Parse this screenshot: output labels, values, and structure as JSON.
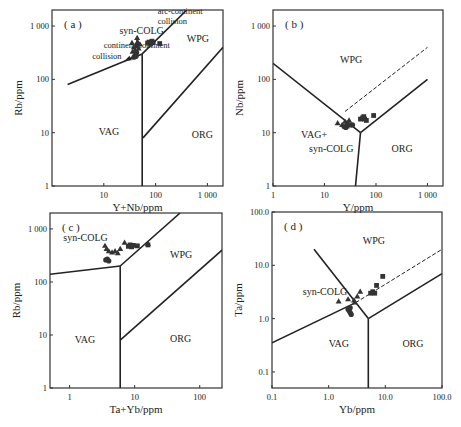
{
  "chart_data": [
    {
      "id": "a",
      "type": "scatter",
      "panel_label": "( a )",
      "xlabel": "Y+Nb/ppm",
      "ylabel": "Rb/ppm",
      "xscale": "log",
      "yscale": "log",
      "xlim": [
        1,
        2000
      ],
      "ylim": [
        1,
        2000
      ],
      "frame": {
        "left": 52,
        "right": 223,
        "top": 10,
        "bottom": 186
      },
      "xticks": [
        {
          "v": 10,
          "label": "10"
        },
        {
          "v": 100,
          "label": "100"
        },
        {
          "v": 1000,
          "label": "1 000"
        }
      ],
      "yticks": [
        {
          "v": 1,
          "label": "1"
        },
        {
          "v": 10,
          "label": "10"
        },
        {
          "v": 100,
          "label": "100"
        },
        {
          "v": 1000,
          "label": "1 000"
        }
      ],
      "boundaries": [
        {
          "style": "solid",
          "points": [
            [
              2,
              80
            ],
            [
              55,
              300
            ]
          ]
        },
        {
          "style": "solid",
          "points": [
            [
              55,
              300
            ],
            [
              400,
              2000
            ]
          ]
        },
        {
          "style": "solid",
          "points": [
            [
              55,
              300
            ],
            [
              55,
              1
            ]
          ]
        },
        {
          "style": "solid",
          "points": [
            [
              57,
              8
            ],
            [
              2000,
              400
            ]
          ]
        }
      ],
      "arrows": [
        {
          "from": [
            47,
            300
          ],
          "to": [
            25,
            220
          ],
          "label": "continent-continent collision"
        },
        {
          "from": [
            45,
            330
          ],
          "to": [
            44,
            600
          ],
          "label": "arc-continent collision"
        }
      ],
      "fields": [
        {
          "label": "VAG",
          "x": 8,
          "y": 9
        },
        {
          "label": "WPG",
          "x": 400,
          "y": 500
        },
        {
          "label": "ORG",
          "x": 500,
          "y": 8
        },
        {
          "label": "syn-COLG",
          "x": 20,
          "y": 700
        }
      ],
      "annotations": [
        {
          "label": "arc-continent",
          "x": 110,
          "y": 1700
        },
        {
          "label": "collision",
          "x": 110,
          "y": 1100
        },
        {
          "label": "continent-continent",
          "x": 10,
          "y": 380
        },
        {
          "label": "collision",
          "x": 6,
          "y": 240
        }
      ],
      "series": [
        {
          "name": "triangle",
          "marker": "triangle",
          "points": [
            [
              35,
              480
            ],
            [
              38,
              400
            ],
            [
              40,
              350
            ],
            [
              42,
              420
            ],
            [
              45,
              500
            ],
            [
              44,
              600
            ],
            [
              47,
              380
            ],
            [
              50,
              450
            ],
            [
              36,
              330
            ],
            [
              41,
              300
            ]
          ]
        },
        {
          "name": "circle",
          "marker": "circle",
          "points": [
            [
              38,
              260
            ],
            [
              40,
              280
            ],
            [
              42,
              270
            ],
            [
              43,
              320
            ]
          ]
        },
        {
          "name": "square",
          "marker": "square",
          "points": [
            [
              70,
              480
            ],
            [
              75,
              500
            ],
            [
              80,
              460
            ],
            [
              85,
              520
            ],
            [
              90,
              490
            ],
            [
              120,
              470
            ]
          ]
        }
      ]
    },
    {
      "id": "b",
      "type": "scatter",
      "panel_label": "( b )",
      "xlabel": "Y/ppm",
      "ylabel": "Nb/ppm",
      "xscale": "log",
      "yscale": "log",
      "xlim": [
        1,
        2000
      ],
      "ylim": [
        1,
        2000
      ],
      "frame": {
        "left": 273,
        "right": 443,
        "top": 10,
        "bottom": 186
      },
      "xticks": [
        {
          "v": 1,
          "label": "1"
        },
        {
          "v": 10,
          "label": "10"
        },
        {
          "v": 100,
          "label": "100"
        },
        {
          "v": 1000,
          "label": "1 000"
        }
      ],
      "yticks": [
        {
          "v": 1,
          "label": "1"
        },
        {
          "v": 10,
          "label": "10"
        },
        {
          "v": 100,
          "label": "100"
        },
        {
          "v": 1000,
          "label": "1 000"
        }
      ],
      "boundaries": [
        {
          "style": "solid",
          "points": [
            [
              1,
              200
            ],
            [
              50,
              10
            ]
          ]
        },
        {
          "style": "solid",
          "points": [
            [
              50,
              10
            ],
            [
              1000,
              100
            ]
          ]
        },
        {
          "style": "solid",
          "points": [
            [
              50,
              10
            ],
            [
              40,
              1
            ]
          ]
        },
        {
          "style": "dashed",
          "points": [
            [
              25,
              25
            ],
            [
              1000,
              400
            ]
          ]
        }
      ],
      "fields": [
        {
          "label": "WPG",
          "x": 20,
          "y": 200
        },
        {
          "label": "VAG+",
          "x": 3.5,
          "y": 8
        },
        {
          "label": "syn-COLG",
          "x": 5,
          "y": 4.3
        },
        {
          "label": "ORG",
          "x": 200,
          "y": 4.3
        }
      ],
      "series": [
        {
          "name": "triangle",
          "marker": "triangle",
          "points": [
            [
              18,
              15
            ],
            [
              22,
              14
            ],
            [
              25,
              16
            ],
            [
              28,
              15
            ],
            [
              30,
              17
            ],
            [
              27,
              13
            ]
          ]
        },
        {
          "name": "circle",
          "marker": "circle",
          "points": [
            [
              24,
              13
            ],
            [
              26,
              12.5
            ],
            [
              28,
              14
            ],
            [
              32,
              14
            ],
            [
              35,
              14
            ]
          ]
        },
        {
          "name": "square",
          "marker": "square",
          "points": [
            [
              50,
              18
            ],
            [
              55,
              19
            ],
            [
              60,
              18
            ],
            [
              65,
              17
            ],
            [
              58,
              20
            ],
            [
              90,
              21
            ]
          ]
        }
      ]
    },
    {
      "id": "c",
      "type": "scatter",
      "panel_label": "( c )",
      "xlabel": "Ta+Yb/ppm",
      "ylabel": "Rb/ppm",
      "xscale": "log",
      "yscale": "log",
      "xlim": [
        0.5,
        220
      ],
      "ylim": [
        1,
        2000
      ],
      "frame": {
        "left": 50,
        "right": 222,
        "top": 213,
        "bottom": 388
      },
      "xticks": [
        {
          "v": 1,
          "label": "1"
        },
        {
          "v": 10,
          "label": "10"
        },
        {
          "v": 100,
          "label": "100"
        }
      ],
      "yticks": [
        {
          "v": 1,
          "label": "1"
        },
        {
          "v": 10,
          "label": "10"
        },
        {
          "v": 100,
          "label": "100"
        },
        {
          "v": 1000,
          "label": "1 000"
        }
      ],
      "boundaries": [
        {
          "style": "solid",
          "points": [
            [
              0.5,
              140
            ],
            [
              6,
              200
            ]
          ]
        },
        {
          "style": "solid",
          "points": [
            [
              6,
              200
            ],
            [
              50,
              2000
            ]
          ]
        },
        {
          "style": "solid",
          "points": [
            [
              6,
              200
            ],
            [
              6,
              1
            ]
          ]
        },
        {
          "style": "solid",
          "points": [
            [
              6,
              8
            ],
            [
              220,
              400
            ]
          ]
        }
      ],
      "fields": [
        {
          "label": "syn-COLG",
          "x": 0.8,
          "y": 600
        },
        {
          "label": "WPG",
          "x": 35,
          "y": 280
        },
        {
          "label": "VAG",
          "x": 1.2,
          "y": 7
        },
        {
          "label": "ORG",
          "x": 35,
          "y": 7.5
        }
      ],
      "series": [
        {
          "name": "triangle",
          "marker": "triangle",
          "points": [
            [
              3.5,
              480
            ],
            [
              3.7,
              420
            ],
            [
              4,
              380
            ],
            [
              4.5,
              360
            ],
            [
              5,
              380
            ],
            [
              5.5,
              350
            ],
            [
              6,
              420
            ],
            [
              7,
              550
            ],
            [
              16,
              520
            ]
          ]
        },
        {
          "name": "circle",
          "marker": "circle",
          "points": [
            [
              3.6,
              260
            ],
            [
              3.8,
              270
            ],
            [
              4,
              250
            ]
          ]
        },
        {
          "name": "square",
          "marker": "square",
          "points": [
            [
              8,
              470
            ],
            [
              8.5,
              500
            ],
            [
              9,
              460
            ],
            [
              9.5,
              490
            ],
            [
              11,
              480
            ],
            [
              16,
              500
            ]
          ]
        }
      ]
    },
    {
      "id": "d",
      "type": "scatter",
      "panel_label": "( d )",
      "xlabel": "Yb/ppm",
      "ylabel": "Ta/ppm",
      "xscale": "log",
      "yscale": "log",
      "xlim": [
        0.1,
        100
      ],
      "ylim": [
        0.05,
        100
      ],
      "frame": {
        "left": 272,
        "right": 442,
        "top": 212,
        "bottom": 388
      },
      "xticks": [
        {
          "v": 0.1,
          "label": "0.1"
        },
        {
          "v": 1,
          "label": "1.0"
        },
        {
          "v": 10,
          "label": "10.0"
        },
        {
          "v": 100,
          "label": "100.0"
        }
      ],
      "yticks": [
        {
          "v": 0.1,
          "label": "0.1"
        },
        {
          "v": 1,
          "label": "1.0"
        },
        {
          "v": 10,
          "label": "10.0"
        },
        {
          "v": 100,
          "label": "100.0"
        }
      ],
      "boundaries": [
        {
          "style": "solid",
          "points": [
            [
              0.1,
              0.35
            ],
            [
              3,
              2
            ]
          ]
        },
        {
          "style": "solid",
          "points": [
            [
              0.55,
              20
            ],
            [
              5,
              1
            ]
          ]
        },
        {
          "style": "solid",
          "points": [
            [
              5,
              1
            ],
            [
              100,
              7
            ]
          ]
        },
        {
          "style": "solid",
          "points": [
            [
              5,
              1
            ],
            [
              5,
              0.05
            ]
          ]
        },
        {
          "style": "dashed",
          "points": [
            [
              3,
              2
            ],
            [
              100,
              20
            ]
          ]
        }
      ],
      "fields": [
        {
          "label": "WPG",
          "x": 4,
          "y": 25
        },
        {
          "label": "syn-COLG",
          "x": 0.35,
          "y": 2.8
        },
        {
          "label": "VAG",
          "x": 1,
          "y": 0.3
        },
        {
          "label": "ORG",
          "x": 20,
          "y": 0.3
        }
      ],
      "series": [
        {
          "name": "triangle",
          "marker": "triangle",
          "points": [
            [
              1.5,
              2.1
            ],
            [
              2.2,
              2.3
            ],
            [
              2.8,
              2.2
            ],
            [
              3.2,
              2.6
            ],
            [
              3.6,
              3.2
            ],
            [
              2.9,
              2.0
            ]
          ]
        },
        {
          "name": "circle",
          "marker": "circle",
          "points": [
            [
              2.2,
              1.5
            ],
            [
              2.3,
              1.4
            ],
            [
              2.4,
              1.3
            ],
            [
              2.5,
              1.2
            ],
            [
              2.4,
              1.6
            ]
          ]
        },
        {
          "name": "square",
          "marker": "square",
          "points": [
            [
              5.5,
              3.0
            ],
            [
              6,
              3.2
            ],
            [
              6.5,
              3.0
            ],
            [
              7,
              4.2
            ],
            [
              9,
              6.2
            ]
          ]
        }
      ]
    }
  ]
}
